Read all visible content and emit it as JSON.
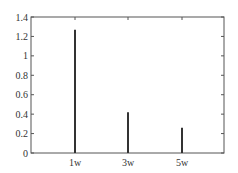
{
  "chart_data": {
    "type": "bar",
    "style": "stem",
    "title": "",
    "xlabel": "",
    "ylabel": "",
    "categories": [
      "1w",
      "3w",
      "5w"
    ],
    "values": [
      1.27,
      0.42,
      0.26
    ],
    "ylim": [
      0,
      1.4
    ],
    "yticks": [
      "0",
      "0.2",
      "0.4",
      "0.6",
      "0.8",
      "1",
      "1.2",
      "1.4"
    ],
    "xticks": [
      "1w",
      "3w",
      "5w"
    ],
    "grid": false,
    "legend": null,
    "bar_color": "#333333",
    "axis_color": "#555555"
  }
}
